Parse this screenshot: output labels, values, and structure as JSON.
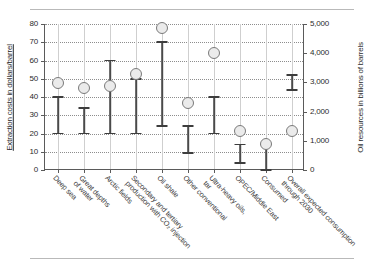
{
  "chart_data": {
    "type": "scatter",
    "title": "",
    "subtitle": "",
    "xlabel": "",
    "ylabel": "Extraction costs in dollars/barrel",
    "y2label": "Oil resources in billions of barrels",
    "ylim": [
      0,
      80
    ],
    "y2lim": [
      0,
      5000
    ],
    "yticks": [
      0,
      10,
      20,
      30,
      40,
      50,
      60,
      70,
      80
    ],
    "ytick_labels": [
      "0",
      "10",
      "20",
      "30",
      "40",
      "50",
      "60",
      "70",
      "80"
    ],
    "y2ticks": [
      0,
      1000,
      2000,
      3000,
      4000,
      5000
    ],
    "y2tick_labels": [
      "0",
      "1,000",
      "2,000",
      "3,000",
      "4,000",
      "5,000"
    ],
    "grid": true,
    "legend": "none",
    "categories": [
      "Deep sea",
      "Great depths\nof water",
      "Arctic fields",
      "Secondary and tertiary\nproduction with CO₂ injection",
      "Oil shale",
      "Other conventional",
      "Ultra-heavy oils,\ntar",
      "OPEC/Middle East",
      "Consumed",
      "Overall expected consumption\nthrough 2030"
    ],
    "series": [
      {
        "name": "Oil resources (billions of barrels)",
        "axis": "right",
        "marker": "open-circle",
        "values": [
          2980,
          2800,
          2890,
          3280,
          4860,
          2310,
          4000,
          1320,
          875,
          1350
        ]
      },
      {
        "name": "Extraction cost range (dollars/barrel)",
        "axis": "left",
        "marker": "error-bar",
        "low": [
          20,
          20,
          20,
          20,
          24,
          9.5,
          20,
          4,
          0,
          44
        ],
        "high": [
          40,
          34,
          60,
          50,
          70,
          24,
          40,
          14,
          14,
          52
        ]
      }
    ],
    "marker_values_left_axis": [
      47.5,
      44.5,
      46,
      52.5,
      77.5,
      37,
      64,
      21,
      14,
      21.5
    ]
  },
  "axes": {
    "left_title": "Extraction costs in dollars/barrel",
    "right_title": "Oil resources in billions of barrels"
  }
}
